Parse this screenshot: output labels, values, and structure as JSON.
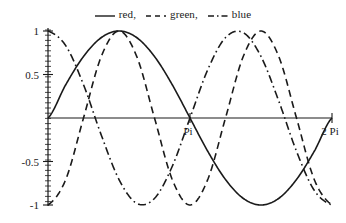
{
  "legend": {
    "entries": [
      {
        "style": "solid",
        "label": "red,",
        "color": "#1a1a1a"
      },
      {
        "style": "dashed",
        "label": "green,",
        "color": "#1a1a1a"
      },
      {
        "style": "dashdot",
        "label": "blue",
        "color": "#1a1a1a"
      }
    ]
  },
  "axis": {
    "y_ticks": [
      {
        "value": 1,
        "label": "1"
      },
      {
        "value": 0.5,
        "label": "0.5"
      },
      {
        "value": -0.5,
        "label": "-0.5"
      },
      {
        "value": -1,
        "label": "-1"
      }
    ],
    "x_ticks": [
      {
        "value": 3.14159265,
        "label": "Pi"
      },
      {
        "value": 6.28318531,
        "label": "2 Pi"
      }
    ]
  },
  "chart_data": {
    "type": "line",
    "title": "",
    "subtitle": "",
    "xlabel": "",
    "ylabel": "",
    "xlim": [
      0,
      6.28318531
    ],
    "ylim": [
      -1,
      1
    ],
    "grid": false,
    "legend_position": "top-center",
    "x_tick_labels": [
      "Pi",
      "2 Pi"
    ],
    "x_tick_values": [
      3.14159265,
      6.28318531
    ],
    "y_tick_labels": [
      "1",
      "0.5",
      "-0.5",
      "-1"
    ],
    "y_tick_values": [
      1,
      0.5,
      -0.5,
      -1
    ],
    "series": [
      {
        "name": "red",
        "linestyle": "solid",
        "color": "#1a1a1a",
        "expression": "sin(x)",
        "x": [
          0,
          0.3927,
          0.7854,
          1.1781,
          1.5708,
          1.9635,
          2.3562,
          2.7489,
          3.1416,
          3.5343,
          3.927,
          4.3197,
          4.7124,
          5.1051,
          5.4978,
          5.8905,
          6.2832
        ],
        "values": [
          0,
          0.3827,
          0.7071,
          0.9239,
          1,
          0.9239,
          0.7071,
          0.3827,
          0,
          -0.3827,
          -0.7071,
          -0.9239,
          -1,
          -0.9239,
          -0.7071,
          -0.3827,
          0
        ]
      },
      {
        "name": "green",
        "linestyle": "dashed",
        "color": "#1a1a1a",
        "expression": "-cos(2x)",
        "x": [
          0,
          0.3927,
          0.7854,
          1.1781,
          1.5708,
          1.9635,
          2.3562,
          2.7489,
          3.1416,
          3.5343,
          3.927,
          4.3197,
          4.7124,
          5.1051,
          5.4978,
          5.8905,
          6.2832
        ],
        "values": [
          -1,
          -0.7071,
          0,
          0.7071,
          1,
          0.7071,
          0,
          -0.7071,
          -1,
          -0.7071,
          0,
          0.7071,
          1,
          0.7071,
          0,
          -0.7071,
          -1
        ]
      },
      {
        "name": "blue",
        "linestyle": "dashdot",
        "color": "#1a1a1a",
        "expression": "cos(1.5x + pi)",
        "x": [
          0,
          0.3927,
          0.7854,
          1.1781,
          1.5708,
          1.9635,
          2.3562,
          2.7489,
          3.1416,
          3.5343,
          3.927,
          4.3197,
          4.7124,
          5.1051,
          5.4978,
          5.8905,
          6.2832
        ],
        "values": [
          1,
          0.8315,
          0.3827,
          -0.1951,
          -0.7071,
          -0.9808,
          -0.9239,
          -0.5556,
          0,
          0.5556,
          0.9239,
          0.9808,
          0.7071,
          0.1951,
          -0.3827,
          -0.8315,
          -1
        ]
      }
    ]
  }
}
